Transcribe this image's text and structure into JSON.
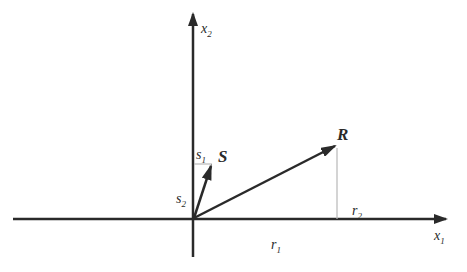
{
  "diagram": {
    "type": "vector-decomposition",
    "colors": {
      "axis": "#2a2a2a",
      "vector": "#2a2a2a",
      "component_line": "#b8b8b8",
      "background": "#ffffff"
    },
    "axes": {
      "x_label": "x",
      "x_sub": "1",
      "y_label": "x",
      "y_sub": "2"
    },
    "vectors": [
      {
        "name": "S",
        "label": "S",
        "components": [
          {
            "label": "s",
            "sub": "1",
            "axis": "x"
          },
          {
            "label": "s",
            "sub": "2",
            "axis": "y"
          }
        ]
      },
      {
        "name": "R",
        "label": "R",
        "components": [
          {
            "label": "r",
            "sub": "1",
            "axis": "x"
          },
          {
            "label": "r",
            "sub": "2",
            "axis": "y"
          }
        ]
      }
    ]
  }
}
